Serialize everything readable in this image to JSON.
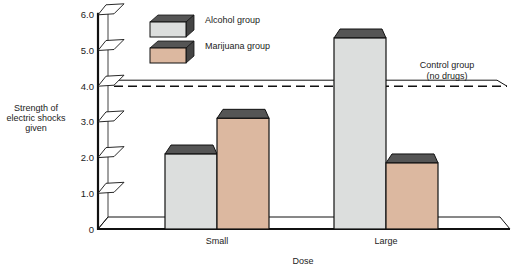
{
  "chart_data": {
    "type": "bar",
    "title": "",
    "xlabel": "Dose",
    "ylabel": "Strength of electric shocks given",
    "ylabel_lines": [
      "Strength of",
      "electric shocks",
      "given"
    ],
    "ylim": [
      0,
      6.0
    ],
    "yticks": [
      "0",
      "1.0",
      "2.0",
      "3.0",
      "4.0",
      "5.0",
      "6.0"
    ],
    "categories": [
      "Small",
      "Large"
    ],
    "series": [
      {
        "name": "Alcohol group",
        "values": [
          2.1,
          5.35
        ],
        "color": "#dcdedd",
        "top_color": "#555555"
      },
      {
        "name": "Marijuana group",
        "values": [
          3.1,
          1.85
        ],
        "color": "#dcb8a0",
        "top_color": "#555555"
      }
    ],
    "reference_line": {
      "label": "Control group\n(no drugs)",
      "label_lines": [
        "Control group",
        "(no drugs)"
      ],
      "value": 4.0,
      "style": "dashed"
    },
    "legend_position": "top-left-inside",
    "grid": false,
    "style": "3d-bar"
  }
}
